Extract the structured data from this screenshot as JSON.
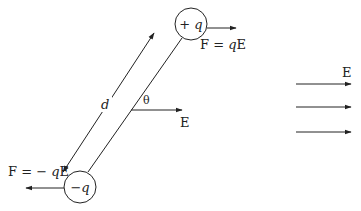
{
  "diagram": {
    "type": "electric-dipole-in-uniform-field",
    "charges": {
      "positive": {
        "label": "+ q",
        "sign": "+",
        "symbol": "q"
      },
      "negative": {
        "label": "− q",
        "sign": "−",
        "symbol": "q"
      }
    },
    "forces": {
      "on_positive": {
        "label": "F = qE",
        "prefix": "F = ",
        "q": "q",
        "suffix": "E"
      },
      "on_negative": {
        "label": "F = − qE",
        "prefix": "F = − ",
        "q": "q",
        "suffix": "E"
      }
    },
    "separation_label": "d",
    "angle_label": "θ",
    "field_label_center": "E",
    "field_label_right": "E",
    "field_lines_count": 3,
    "colors": {
      "stroke": "#222222",
      "background": "#ffffff"
    }
  }
}
